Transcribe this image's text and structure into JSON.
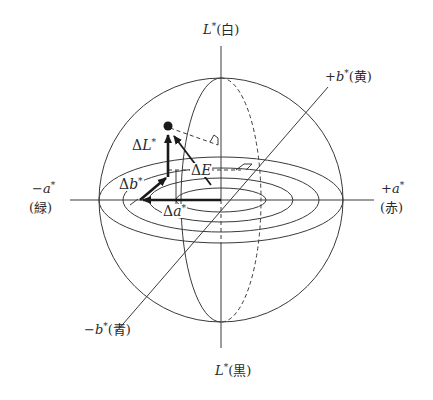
{
  "diagram": {
    "axes": {
      "L_top": {
        "var": "L",
        "star": "*",
        "note": "(白)"
      },
      "L_bottom": {
        "var": "L",
        "star": "*",
        "note": "(黒)"
      },
      "b_plus": {
        "sign": "+",
        "var": "b",
        "star": "*",
        "note": "(黄)"
      },
      "b_minus": {
        "sign": "−",
        "var": "b",
        "star": "*",
        "note": "(青)"
      },
      "a_minus": {
        "sign": "−",
        "var": "a",
        "star": "*",
        "note": "(緑)"
      },
      "a_plus": {
        "sign": "+",
        "var": "a",
        "star": "*",
        "note": "(赤)"
      }
    },
    "vectors": {
      "dL": {
        "delta": "Δ",
        "var": "L",
        "star": "*"
      },
      "db": {
        "delta": "Δ",
        "var": "b",
        "star": "*"
      },
      "da": {
        "delta": "Δ",
        "var": "a",
        "star": "*"
      },
      "dE": {
        "delta": "Δ",
        "var": "E"
      }
    },
    "colors": {
      "line": "#3a3a3a",
      "arrow": "#1a1a1a",
      "background": "#ffffff"
    }
  }
}
